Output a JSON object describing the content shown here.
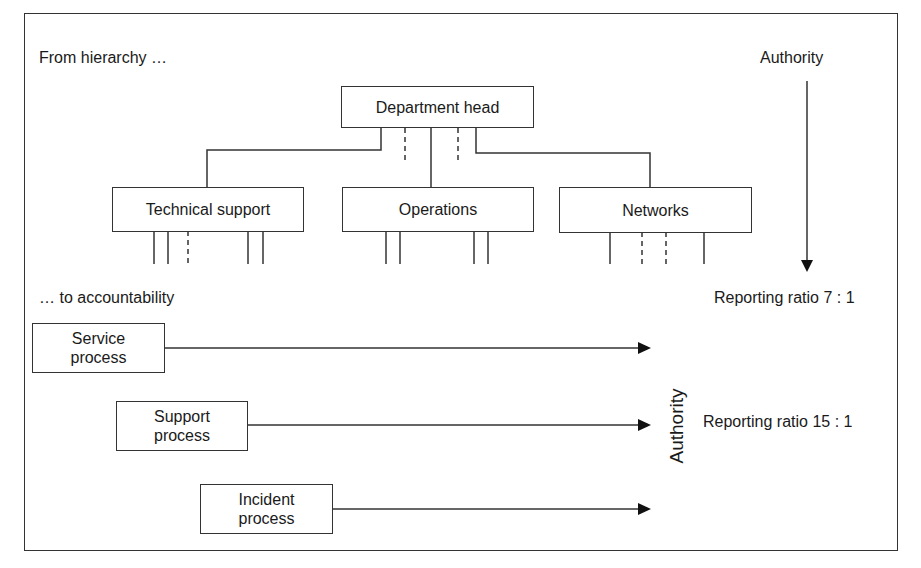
{
  "diagram": {
    "top_section": {
      "heading": "From hierarchy …",
      "authority_label": "Authority",
      "reporting_ratio": "Reporting ratio 7 : 1",
      "root_node": "Department head",
      "child_nodes": [
        {
          "label": "Technical support",
          "reports_solid": 4,
          "reports_dashed": 1
        },
        {
          "label": "Operations",
          "reports_solid": 4,
          "reports_dashed": 0
        },
        {
          "label": "Networks",
          "reports_solid": 2,
          "reports_dashed": 2
        }
      ],
      "root_direct_reports": {
        "solid": 1,
        "dashed": 2
      }
    },
    "bottom_section": {
      "heading": "… to accountability",
      "authority_label": "Authority",
      "reporting_ratio": "Reporting ratio 15 : 1",
      "processes": [
        {
          "line1": "Service",
          "line2": "process"
        },
        {
          "line1": "Support",
          "line2": "process"
        },
        {
          "line1": "Incident",
          "line2": "process"
        }
      ]
    },
    "colors": {
      "line": "#333333",
      "text": "#1a1a1a",
      "background": "#ffffff"
    }
  }
}
